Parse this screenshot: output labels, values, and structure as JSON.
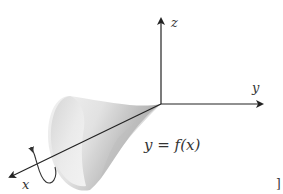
{
  "figure": {
    "axes": {
      "x_label": "x",
      "y_label": "y",
      "z_label": "z"
    },
    "curve_label": "y = f(x)",
    "rotation_axis": "x",
    "corner_mark": "]",
    "colors": {
      "axis": "#222222",
      "surface_light": "#f4f4f4",
      "surface_mid": "#d6d6d6",
      "surface_dark": "#9a9a9a",
      "text": "#333333"
    }
  }
}
